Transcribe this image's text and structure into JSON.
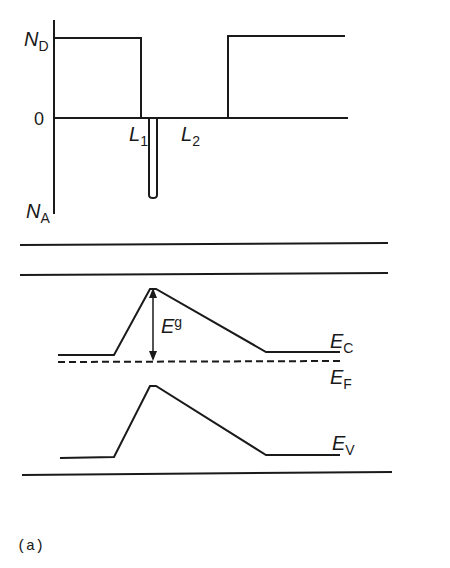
{
  "doping_profile": {
    "y_axis": {
      "top_label": "N",
      "top_sub": "D",
      "zero_label": "0",
      "bottom_label": "N",
      "bottom_sub": "A"
    },
    "x_labels": [
      {
        "label": "L",
        "sub": "1"
      },
      {
        "label": "L",
        "sub": "2"
      }
    ]
  },
  "band_diagram": {
    "labels": {
      "Eg": {
        "label": "E",
        "sub": "g"
      },
      "Ec": {
        "label": "E",
        "sub": "C"
      },
      "Ef": {
        "label": "E",
        "sub": "F"
      },
      "Ev": {
        "label": "E",
        "sub": "V"
      }
    }
  },
  "caption": "(a)",
  "colors": {
    "ink": "#1a1a1a",
    "background": "#ffffff"
  }
}
